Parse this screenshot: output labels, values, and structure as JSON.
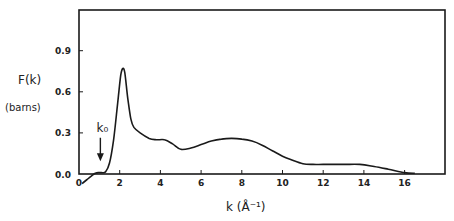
{
  "chart_data": {
    "type": "line",
    "title": "",
    "xlabel": "k (Å⁻¹)",
    "ylabel": "F(k)",
    "ylabel_unit": "(barns)",
    "xlim": [
      0,
      18
    ],
    "ylim": [
      0,
      1.2
    ],
    "x_ticks": [
      0,
      2,
      4,
      6,
      8,
      10,
      12,
      14,
      16
    ],
    "x_tick_labels": [
      "0",
      "2",
      "4",
      "6",
      "8",
      "10",
      "12",
      "14",
      "16"
    ],
    "y_ticks": [
      0.0,
      0.3,
      0.6,
      0.9
    ],
    "y_tick_labels": [
      "0.0",
      "0.3",
      "0.6",
      "0.9"
    ],
    "grid": false,
    "legend": null,
    "series": [
      {
        "name": "F(k)",
        "color": "#1a1a1a",
        "x": [
          0.15,
          0.4,
          0.65,
          0.8,
          0.95,
          1.1,
          1.3,
          1.5,
          1.7,
          1.9,
          2.05,
          2.15,
          2.25,
          2.4,
          2.55,
          2.7,
          3.0,
          3.45,
          3.8,
          4.2,
          4.6,
          5.0,
          5.5,
          6.0,
          6.5,
          7.0,
          7.5,
          8.0,
          8.5,
          9.0,
          9.5,
          10.0,
          10.5,
          11.0,
          11.5,
          12.0,
          13.0,
          13.8,
          14.5,
          15.2,
          16.0,
          16.5
        ],
        "y": [
          -0.07,
          -0.04,
          -0.01,
          0.005,
          0.01,
          0.01,
          0.015,
          0.08,
          0.25,
          0.52,
          0.72,
          0.77,
          0.74,
          0.55,
          0.4,
          0.34,
          0.3,
          0.26,
          0.25,
          0.25,
          0.22,
          0.18,
          0.19,
          0.215,
          0.24,
          0.255,
          0.26,
          0.255,
          0.24,
          0.21,
          0.17,
          0.13,
          0.1,
          0.075,
          0.07,
          0.07,
          0.07,
          0.07,
          0.055,
          0.035,
          0.01,
          0.005
        ]
      }
    ],
    "annotations": [
      {
        "text": "k₀",
        "arrow_to": {
          "x": 1.05,
          "y": 0.02
        },
        "arrow_from": {
          "x": 1.05,
          "y": 0.25
        }
      }
    ]
  }
}
